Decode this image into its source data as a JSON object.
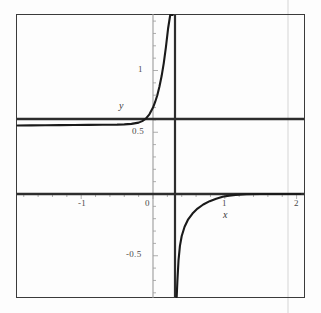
{
  "figure": {
    "background_color": "#fdfdfd",
    "frame_color": "#3b3b3b",
    "curve_color": "#1a1a1a",
    "axis_color": "#8a8a8a",
    "asymptote_color": "#2a2a2a",
    "scan_artifact_color": "#e9e9e9"
  },
  "axis_titles": {
    "x": "x",
    "y": "y"
  },
  "x_tick_labels": [
    {
      "text": "-1",
      "value": -1
    },
    {
      "text": "0",
      "value": 0
    },
    {
      "text": "1",
      "value": 1
    },
    {
      "text": "2",
      "value": 2
    }
  ],
  "y_tick_labels": [
    {
      "text": "1",
      "value": 1
    },
    {
      "text": "0.5",
      "value": 0.5
    },
    {
      "text": "-0.5",
      "value": -0.5
    }
  ],
  "chart_data": {
    "type": "line",
    "title": "",
    "xlabel": "x",
    "ylabel": "y",
    "xlim": [
      -1.9,
      2.05
    ],
    "ylim": [
      -1.1,
      1.6
    ],
    "grid": false,
    "legend": "none",
    "x_ticks_major": [
      -1,
      0,
      1,
      2
    ],
    "x_ticks_minor_step": 0.2,
    "y_ticks_major": [
      1,
      0.5,
      -0.5
    ],
    "y_ticks_minor_step": 0.1,
    "axes_drawn": [
      "x-axis at y=0",
      "y-axis at x=0"
    ],
    "annotations": [
      {
        "name": "horizontal-asymptote",
        "type": "horizontal-line",
        "y": 0.62,
        "x_from": -1.9,
        "x_to": 2.05
      },
      {
        "name": "vertical-asymptote",
        "type": "vertical-line",
        "x": 0.3,
        "y_from": -1.1,
        "y_to": 1.6
      }
    ],
    "series": [
      {
        "name": "left-branch",
        "description": "upper-left branch approaching y=0.62 from below as x decreases, rising steeply to +infinity as x approaches 0.3 from the left",
        "points": [
          [
            -1.9,
            0.555
          ],
          [
            -1.7,
            0.556
          ],
          [
            -1.5,
            0.557
          ],
          [
            -1.3,
            0.558
          ],
          [
            -1.1,
            0.559
          ],
          [
            -0.9,
            0.56
          ],
          [
            -0.7,
            0.561
          ],
          [
            -0.5,
            0.562
          ],
          [
            -0.4,
            0.564
          ],
          [
            -0.3,
            0.568
          ],
          [
            -0.2,
            0.578
          ],
          [
            -0.15,
            0.59
          ],
          [
            -0.1,
            0.61
          ],
          [
            -0.05,
            0.645
          ],
          [
            0.0,
            0.7
          ],
          [
            0.03,
            0.745
          ],
          [
            0.06,
            0.8
          ],
          [
            0.09,
            0.87
          ],
          [
            0.12,
            0.955
          ],
          [
            0.15,
            1.06
          ],
          [
            0.18,
            1.19
          ],
          [
            0.21,
            1.34
          ],
          [
            0.24,
            1.47
          ],
          [
            0.26,
            1.56
          ],
          [
            0.275,
            1.6
          ]
        ]
      },
      {
        "name": "right-branch",
        "description": "lower-right branch coming up from -infinity just right of x=0.3, rising toward y=0 and flattening just past x=1",
        "points": [
          [
            0.325,
            -1.1
          ],
          [
            0.33,
            -0.9
          ],
          [
            0.34,
            -0.7
          ],
          [
            0.355,
            -0.54
          ],
          [
            0.375,
            -0.42
          ],
          [
            0.4,
            -0.34
          ],
          [
            0.44,
            -0.265
          ],
          [
            0.49,
            -0.205
          ],
          [
            0.55,
            -0.158
          ],
          [
            0.62,
            -0.118
          ],
          [
            0.7,
            -0.085
          ],
          [
            0.79,
            -0.058
          ],
          [
            0.88,
            -0.038
          ],
          [
            0.97,
            -0.023
          ],
          [
            1.06,
            -0.013
          ],
          [
            1.15,
            -0.007
          ],
          [
            1.3,
            -0.002
          ],
          [
            1.5,
            0.0
          ],
          [
            1.75,
            0.0
          ],
          [
            2.05,
            0.0
          ]
        ]
      }
    ]
  }
}
